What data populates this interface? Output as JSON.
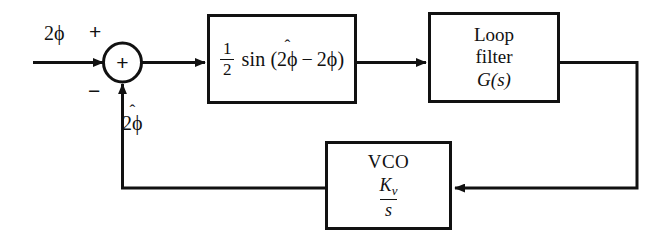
{
  "diagram": {
    "line_color": "#111111",
    "background": "#ffffff",
    "summing_junction": {
      "inner_symbol": "+",
      "input_sign": "+",
      "feedback_sign": "−"
    },
    "signals": {
      "input_label": "2ϕ",
      "feedback_label_base": "2ϕ",
      "feedback_label_hat": "ˆ"
    },
    "blocks": {
      "mixer": {
        "fraction_numerator": "1",
        "fraction_denominator": "2",
        "function_name": "sin",
        "open_paren": "(",
        "arg_first": "2ϕ",
        "arg_first_hat": "ˆ",
        "operator": "−",
        "arg_second": "2ϕ",
        "close_paren": ")"
      },
      "loop_filter": {
        "line1": "Loop",
        "line2": "filter",
        "line3": "G(s)"
      },
      "vco": {
        "title": "VCO",
        "gain_symbol": "K",
        "gain_subscript": "v",
        "denominator": "s"
      }
    }
  }
}
